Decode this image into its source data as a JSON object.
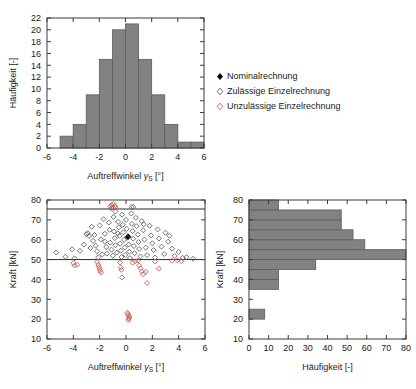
{
  "figure": {
    "axis_labels": {
      "angle": "Auftreffwinkel",
      "angle_symbol": "γ",
      "angle_subscript": "S",
      "angle_unit": "[°]",
      "force": "Kraft [kN]",
      "frequency": "Häufigkeit [-]"
    },
    "colors": {
      "bar_fill": "#828282",
      "bar_edge": "#5b5b5b",
      "marker_valid": "#5a5a5a",
      "marker_invalid": "#c4564a",
      "marker_nominal": "#000000",
      "axis": "#3a3a3a"
    }
  },
  "legend": {
    "items": [
      {
        "label": "Nominalrechnung",
        "marker": "filled-diamond-icon",
        "color": "#000000"
      },
      {
        "label": "Zulässige Einzelrechnung",
        "marker": "open-diamond-icon",
        "color": "#5a5a5a"
      },
      {
        "label": "Unzulässige Einzelrechnung",
        "marker": "open-diamond-red-icon",
        "color": "#c4564a"
      }
    ]
  },
  "chart_data": [
    {
      "id": "angle-histogram",
      "type": "bar",
      "title": "",
      "xlabel": "Auftreffwinkel γS [°]",
      "ylabel": "Häufigkeit [-]",
      "xlim": [
        -6,
        6
      ],
      "ylim": [
        0,
        22
      ],
      "xticks": [
        -6,
        -4,
        -2,
        0,
        2,
        4,
        6
      ],
      "yticks": [
        0,
        2,
        4,
        6,
        8,
        10,
        12,
        14,
        16,
        18,
        20,
        22
      ],
      "bin_width": 1,
      "grid": false,
      "orientation": "vertical",
      "bins": [
        {
          "x0": -5,
          "x1": -4,
          "value": 2
        },
        {
          "x0": -4,
          "x1": -3,
          "value": 4
        },
        {
          "x0": -3,
          "x1": -2,
          "value": 9
        },
        {
          "x0": -2,
          "x1": -1,
          "value": 15
        },
        {
          "x0": -1,
          "x1": 0,
          "value": 20
        },
        {
          "x0": 0,
          "x1": 1,
          "value": 21
        },
        {
          "x0": 1,
          "x1": 2,
          "value": 15
        },
        {
          "x0": 2,
          "x1": 3,
          "value": 9
        },
        {
          "x0": 3,
          "x1": 4,
          "value": 4
        },
        {
          "x0": 4,
          "x1": 5,
          "value": 1
        },
        {
          "x0": 5,
          "x1": 6,
          "value": 1
        }
      ]
    },
    {
      "id": "force-angle-scatter",
      "type": "scatter",
      "title": "",
      "xlabel": "Auftreffwinkel γS [°]",
      "ylabel": "Kraft [kN]",
      "xlim": [
        -6,
        6
      ],
      "ylim": [
        10,
        80
      ],
      "xticks": [
        -6,
        -4,
        -2,
        0,
        2,
        4,
        6
      ],
      "yticks": [
        10,
        20,
        30,
        40,
        50,
        60,
        70,
        80
      ],
      "grid": false,
      "reference_lines": [
        {
          "name": "lower-limit",
          "axis": "y",
          "value": 50,
          "color": "#2b2b2b"
        },
        {
          "name": "upper-limit",
          "axis": "y",
          "value": 75.5,
          "color": "#6f6f6f"
        }
      ],
      "series": [
        {
          "name": "Nominalrechnung",
          "marker": "filled-diamond",
          "color": "#000000",
          "points": [
            [
              0.15,
              61.5
            ]
          ]
        },
        {
          "name": "Zulässige Einzelrechnung",
          "marker": "open-diamond",
          "color": "#5a5a5a",
          "points": [
            [
              -5.3,
              53.6
            ],
            [
              -4.6,
              51.4
            ],
            [
              -4.1,
              55.2
            ],
            [
              -3.9,
              50.6
            ],
            [
              -3.5,
              54.4
            ],
            [
              -3.2,
              57.5
            ],
            [
              -3.0,
              62.8
            ],
            [
              -2.9,
              63.3
            ],
            [
              -2.8,
              61.9
            ],
            [
              -2.6,
              66.5
            ],
            [
              -2.5,
              59.4
            ],
            [
              -2.4,
              62.4
            ],
            [
              -2.3,
              57.0
            ],
            [
              -2.2,
              54.2
            ],
            [
              -2.1,
              51.1
            ],
            [
              -2.0,
              67.2
            ],
            [
              -1.9,
              60.2
            ],
            [
              -1.8,
              52.6
            ],
            [
              -1.7,
              70.3
            ],
            [
              -1.6,
              63.0
            ],
            [
              -1.5,
              56.3
            ],
            [
              -1.45,
              53.0
            ],
            [
              -1.3,
              68.6
            ],
            [
              -1.25,
              65.0
            ],
            [
              -1.2,
              58.5
            ],
            [
              -1.1,
              55.0
            ],
            [
              -1.0,
              52.0
            ],
            [
              -0.95,
              71.5
            ],
            [
              -0.9,
              64.1
            ],
            [
              -0.85,
              60.8
            ],
            [
              -0.8,
              57.2
            ],
            [
              -0.7,
              53.5
            ],
            [
              -0.6,
              69.0
            ],
            [
              -0.55,
              66.2
            ],
            [
              -0.5,
              62.0
            ],
            [
              -0.45,
              58.0
            ],
            [
              -0.4,
              54.5
            ],
            [
              -0.35,
              51.3
            ],
            [
              -0.3,
              72.6
            ],
            [
              -0.25,
              67.5
            ],
            [
              -0.2,
              63.7
            ],
            [
              -0.15,
              59.9
            ],
            [
              -0.1,
              56.1
            ],
            [
              -0.05,
              52.4
            ],
            [
              0.0,
              70.0
            ],
            [
              0.05,
              65.5
            ],
            [
              0.1,
              61.0
            ],
            [
              0.2,
              57.6
            ],
            [
              0.25,
              54.0
            ],
            [
              0.3,
              50.8
            ],
            [
              0.4,
              73.2
            ],
            [
              0.45,
              68.0
            ],
            [
              0.5,
              64.3
            ],
            [
              0.55,
              60.5
            ],
            [
              0.6,
              56.8
            ],
            [
              0.65,
              53.2
            ],
            [
              0.75,
              71.0
            ],
            [
              0.8,
              66.8
            ],
            [
              0.9,
              62.6
            ],
            [
              0.95,
              58.8
            ],
            [
              1.0,
              55.3
            ],
            [
              1.1,
              51.6
            ],
            [
              1.2,
              69.4
            ],
            [
              1.3,
              64.8
            ],
            [
              1.4,
              60.0
            ],
            [
              1.5,
              56.0
            ],
            [
              1.6,
              52.2
            ],
            [
              1.8,
              67.0
            ],
            [
              1.9,
              62.2
            ],
            [
              2.0,
              58.2
            ],
            [
              2.1,
              54.8
            ],
            [
              2.2,
              51.0
            ],
            [
              2.4,
              65.2
            ],
            [
              2.5,
              60.6
            ],
            [
              2.7,
              56.5
            ],
            [
              2.9,
              52.8
            ],
            [
              3.0,
              63.5
            ],
            [
              3.2,
              59.0
            ],
            [
              3.3,
              62.0
            ],
            [
              3.5,
              55.5
            ],
            [
              3.7,
              51.8
            ],
            [
              4.0,
              53.8
            ],
            [
              4.3,
              50.9
            ],
            [
              4.6,
              51.2
            ],
            [
              5.1,
              50.4
            ],
            [
              -1.1,
              75.8
            ],
            [
              -0.8,
              74.2
            ],
            [
              0.45,
              76.4
            ],
            [
              -1.6,
              59.0
            ],
            [
              -2.7,
              55.8
            ],
            [
              1.35,
              67.8
            ],
            [
              -0.62,
              63.2
            ]
          ]
        },
        {
          "name": "Unzulässige Einzelrechnung",
          "marker": "open-diamond",
          "color": "#c4564a",
          "points": [
            [
              -1.2,
              76.8
            ],
            [
              -1.1,
              77.5
            ],
            [
              -1.0,
              76.2
            ],
            [
              -0.95,
              78.1
            ],
            [
              -0.85,
              77.0
            ],
            [
              -0.8,
              76.5
            ],
            [
              0.55,
              76.6
            ],
            [
              -3.9,
              47.0
            ],
            [
              -3.7,
              47.4
            ],
            [
              -2.2,
              48.8
            ],
            [
              -2.1,
              47.3
            ],
            [
              -2.05,
              46.2
            ],
            [
              -2.0,
              45.3
            ],
            [
              -1.95,
              44.4
            ],
            [
              -1.9,
              43.4
            ],
            [
              -0.45,
              48.5
            ],
            [
              -0.4,
              46.0
            ],
            [
              -0.35,
              44.8
            ],
            [
              -0.3,
              41.0
            ],
            [
              0.5,
              48.4
            ],
            [
              0.7,
              49.2
            ],
            [
              0.9,
              49.5
            ],
            [
              1.0,
              47.0
            ],
            [
              1.1,
              45.6
            ],
            [
              1.2,
              44.0
            ],
            [
              1.3,
              42.6
            ],
            [
              1.5,
              43.8
            ],
            [
              1.6,
              38.2
            ],
            [
              2.2,
              49.0
            ],
            [
              2.5,
              45.4
            ],
            [
              3.5,
              49.4
            ],
            [
              3.9,
              49.6
            ],
            [
              4.2,
              49.2
            ],
            [
              -4.0,
              48.2
            ],
            [
              0.15,
              22.6
            ],
            [
              0.2,
              21.8
            ],
            [
              0.25,
              21.0
            ],
            [
              0.1,
              23.2
            ],
            [
              0.18,
              19.6
            ],
            [
              0.22,
              20.4
            ]
          ]
        }
      ]
    },
    {
      "id": "force-histogram",
      "type": "bar",
      "title": "",
      "xlabel": "Häufigkeit [-]",
      "ylabel": "Kraft [kN]",
      "xlim": [
        0,
        80
      ],
      "ylim": [
        10,
        80
      ],
      "xticks": [
        0,
        10,
        20,
        30,
        40,
        50,
        60,
        70,
        80
      ],
      "yticks": [
        10,
        20,
        30,
        40,
        50,
        60,
        70,
        80
      ],
      "bin_width": 5,
      "grid": false,
      "orientation": "horizontal",
      "bins": [
        {
          "y0": 20,
          "y1": 25,
          "value": 8
        },
        {
          "y0": 35,
          "y1": 40,
          "value": 15
        },
        {
          "y0": 40,
          "y1": 45,
          "value": 15
        },
        {
          "y0": 45,
          "y1": 50,
          "value": 34
        },
        {
          "y0": 50,
          "y1": 55,
          "value": 80
        },
        {
          "y0": 55,
          "y1": 60,
          "value": 59
        },
        {
          "y0": 60,
          "y1": 65,
          "value": 53
        },
        {
          "y0": 65,
          "y1": 70,
          "value": 47
        },
        {
          "y0": 70,
          "y1": 75,
          "value": 47
        },
        {
          "y0": 75,
          "y1": 80,
          "value": 15
        }
      ]
    }
  ]
}
